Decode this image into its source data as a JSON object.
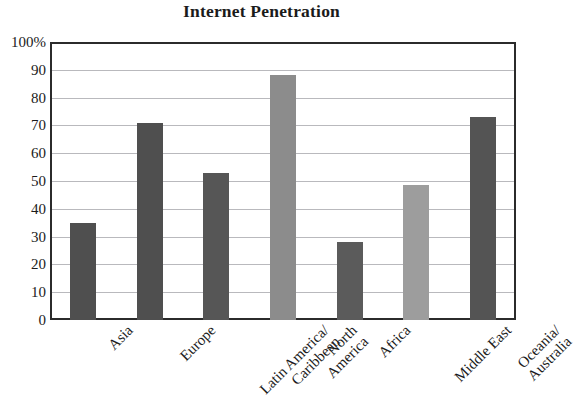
{
  "chart_data": {
    "type": "bar",
    "title": "Internet Penetration",
    "xlabel": "",
    "ylabel": "",
    "ylim": [
      0,
      100
    ],
    "grid": true,
    "legend": false,
    "categories": [
      "Asia",
      "Europe",
      "Latin America/\nCaribbean",
      "North\nAmerica",
      "Africa",
      "Middle East",
      "Oceania/\nAustralia"
    ],
    "values": [
      35,
      71,
      53,
      88,
      28,
      48.5,
      73
    ],
    "bar_colors": [
      "#4f4f4f",
      "#4f4f4f",
      "#565656",
      "#8c8c8c",
      "#5b5b5b",
      "#9d9d9d",
      "#545454"
    ],
    "ytick_labels": [
      "100%",
      "90",
      "80",
      "70",
      "60",
      "50",
      "40",
      "30",
      "20",
      "10",
      "0"
    ],
    "ytick_values": [
      100,
      90,
      80,
      70,
      60,
      50,
      40,
      30,
      20,
      10,
      0
    ],
    "axis_color": "#2b2b2b",
    "grid_color": "#b9b9bd",
    "text_color": "#1b1b1b",
    "background": "#ffffff"
  }
}
